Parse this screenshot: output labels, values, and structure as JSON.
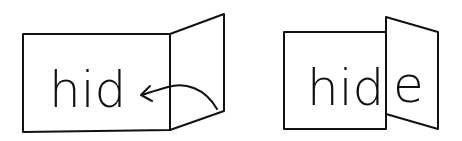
{
  "diagram": {
    "left_panel": {
      "card_word": "hid",
      "flap_state": "open",
      "arrow": "curved arrow pointing from flap toward word"
    },
    "right_panel": {
      "card_word": "hid",
      "flap_letter": "e",
      "flap_state": "folded",
      "combined_word": "hide"
    }
  },
  "colors": {
    "ink": "#111111",
    "paper": "#ffffff"
  }
}
